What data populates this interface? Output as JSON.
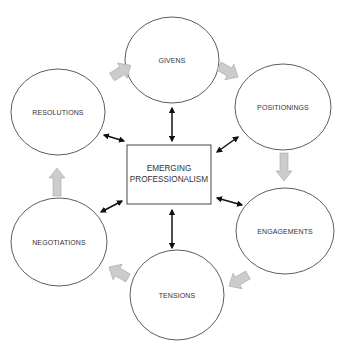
{
  "diagram": {
    "center": {
      "line1": "EMERGING",
      "line2": "PROFESSIONALISM"
    },
    "nodes": [
      {
        "id": "givens",
        "label": "GIVENS"
      },
      {
        "id": "positionings",
        "label": "POSITIONINGS"
      },
      {
        "id": "engagements",
        "label": "ENGAGEMENTS"
      },
      {
        "id": "tensions",
        "label": "TENSIONS"
      },
      {
        "id": "negotiations",
        "label": "NEGOTIATIONS"
      },
      {
        "id": "resolutions",
        "label": "RESOLUTIONS"
      }
    ],
    "cycle_order": [
      "GIVENS",
      "POSITIONINGS",
      "ENGAGEMENTS",
      "TENSIONS",
      "NEGOTIATIONS",
      "RESOLUTIONS"
    ],
    "colors": {
      "node_stroke": "#333333",
      "cycle_arrow_fill": "#cccccc",
      "cycle_arrow_stroke": "#a8a8a8",
      "link_arrow": "#111111"
    }
  }
}
